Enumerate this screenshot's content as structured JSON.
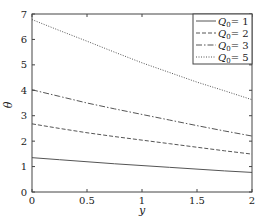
{
  "chart_data": {
    "type": "line",
    "title": "",
    "xlabel": "y",
    "ylabel": "θ",
    "xlim": [
      0,
      2
    ],
    "ylim": [
      0,
      7
    ],
    "xticks": [
      "0",
      "0.5",
      "1",
      "1.5",
      "2"
    ],
    "yticks": [
      "0",
      "1",
      "2",
      "3",
      "4",
      "5",
      "6",
      "7"
    ],
    "grid": false,
    "legend_position": "upper right",
    "x": [
      0,
      0.25,
      0.5,
      0.75,
      1,
      1.25,
      1.5,
      1.75,
      2
    ],
    "series": [
      {
        "name": "Q0 = 1",
        "style": "solid",
        "values": [
          1.35,
          1.27,
          1.19,
          1.11,
          1.04,
          0.97,
          0.9,
          0.83,
          0.77
        ]
      },
      {
        "name": "Q0 = 2",
        "style": "dashed",
        "values": [
          2.68,
          2.5,
          2.33,
          2.18,
          2.04,
          1.9,
          1.76,
          1.62,
          1.49
        ]
      },
      {
        "name": "Q0 = 3",
        "style": "dashdot",
        "values": [
          4.02,
          3.76,
          3.5,
          3.27,
          3.05,
          2.83,
          2.61,
          2.4,
          2.2
        ]
      },
      {
        "name": "Q0 = 5",
        "style": "dotted",
        "values": [
          6.78,
          6.35,
          5.93,
          5.5,
          5.08,
          4.7,
          4.32,
          3.98,
          3.63
        ]
      }
    ]
  },
  "legend": {
    "labels": [
      "Q",
      "Q",
      "Q",
      "Q"
    ],
    "subscripts": [
      "0",
      "0",
      "0",
      "0"
    ],
    "values": [
      "= 1",
      "= 2",
      "= 3",
      "= 5"
    ]
  }
}
